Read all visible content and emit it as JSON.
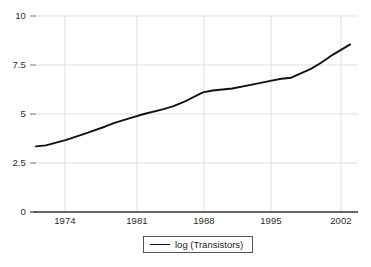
{
  "chart_data": {
    "type": "line",
    "title": "",
    "xlabel": "",
    "ylabel": "",
    "xlim": [
      1971,
      2003.8
    ],
    "ylim": [
      0,
      10
    ],
    "grid": true,
    "legend_position": "bottom-center",
    "x_ticks": [
      "1974",
      "1981",
      "1988",
      "1995",
      "2002"
    ],
    "x_tick_values": [
      1974,
      1981,
      1988,
      1995,
      2002
    ],
    "y_ticks": [
      "0",
      "2.5",
      "5",
      "7.5",
      "10"
    ],
    "y_tick_values": [
      0,
      2.5,
      5,
      7.5,
      10
    ],
    "series": [
      {
        "name": "log (Transistors)",
        "color": "#111111",
        "x": [
          1971,
          1972,
          1974,
          1976,
          1978,
          1979,
          1981,
          1982,
          1984,
          1985,
          1986,
          1988,
          1989,
          1991,
          1993,
          1995,
          1996,
          1997,
          1999,
          2000,
          2001,
          2003
        ],
        "values": [
          3.35,
          3.4,
          3.67,
          4.0,
          4.35,
          4.55,
          4.85,
          5.0,
          5.25,
          5.4,
          5.6,
          6.1,
          6.2,
          6.3,
          6.5,
          6.7,
          6.8,
          6.85,
          7.3,
          7.6,
          7.95,
          8.55
        ]
      }
    ]
  },
  "legend": {
    "entries": [
      {
        "label": "log (Transistors)",
        "color": "#111111"
      }
    ]
  },
  "axes": {
    "x_axis_color": "#333333",
    "grid_color": "#d8d8d8",
    "tick_text_color": "#2b2b2b"
  }
}
